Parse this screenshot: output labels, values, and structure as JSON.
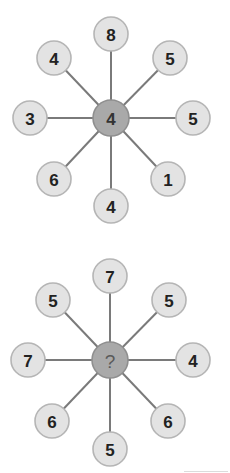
{
  "puzzle": {
    "diagrams": [
      {
        "center_label": "4",
        "spokes": [
          {
            "direction": "top",
            "label": "8"
          },
          {
            "direction": "top-right",
            "label": "5"
          },
          {
            "direction": "right",
            "label": "5"
          },
          {
            "direction": "bottom-right",
            "label": "1"
          },
          {
            "direction": "bottom",
            "label": "4"
          },
          {
            "direction": "bottom-left",
            "label": "6"
          },
          {
            "direction": "left",
            "label": "3"
          },
          {
            "direction": "top-left",
            "label": "4"
          }
        ]
      },
      {
        "center_label": "?",
        "spokes": [
          {
            "direction": "top",
            "label": "7"
          },
          {
            "direction": "top-right",
            "label": "5"
          },
          {
            "direction": "right",
            "label": "4"
          },
          {
            "direction": "bottom-right",
            "label": "6"
          },
          {
            "direction": "bottom",
            "label": "5"
          },
          {
            "direction": "bottom-left",
            "label": "6"
          },
          {
            "direction": "left",
            "label": "7"
          },
          {
            "direction": "top-left",
            "label": "5"
          }
        ]
      }
    ],
    "colors": {
      "outer_fill": "#e3e3e3",
      "center_fill": "#a9a9a9",
      "spoke": "#7a7a7a"
    }
  }
}
